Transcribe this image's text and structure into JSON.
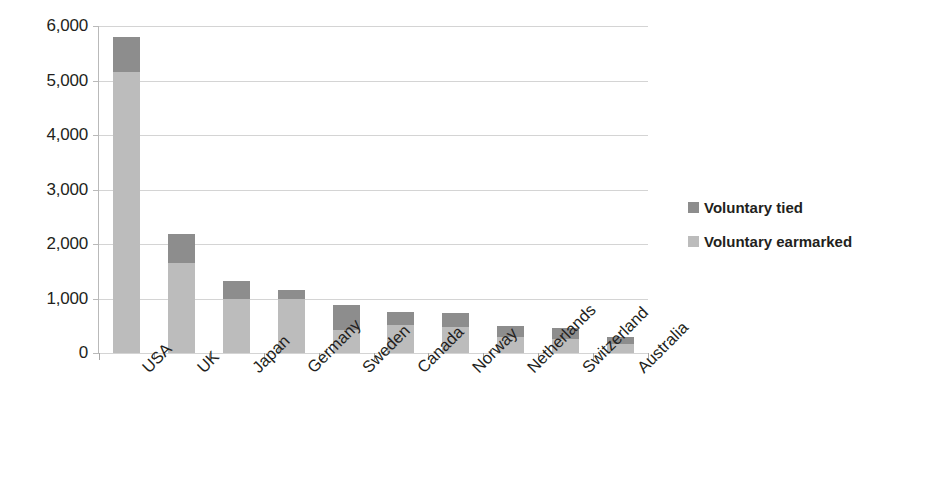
{
  "chart_data": {
    "type": "bar",
    "subtype": "stacked-vertical",
    "title": "",
    "xlabel": "",
    "ylabel": "",
    "ylim": [
      0,
      6000
    ],
    "ytick_labels": [
      "6,000",
      "5,000",
      "4,000",
      "3,000",
      "2,000",
      "1,000",
      "0"
    ],
    "ytick_values": [
      6000,
      5000,
      4000,
      3000,
      2000,
      1000,
      0
    ],
    "grid": true,
    "grid_axis": "y",
    "legend_position": "right",
    "categories": [
      "USA",
      "UK",
      "Japan",
      "Germany",
      "Sweden",
      "Canada",
      "Norway",
      "Netherlands",
      "Switzerland",
      "Australia"
    ],
    "series": [
      {
        "name": "Voluntary earmarked",
        "color": "#bcbcbc",
        "values": [
          5150,
          1660,
          990,
          990,
          430,
          520,
          480,
          295,
          260,
          165
        ]
      },
      {
        "name": "Voluntary tied",
        "color": "#8d8d8d",
        "values": [
          650,
          530,
          330,
          165,
          450,
          230,
          260,
          200,
          200,
          125
        ]
      }
    ],
    "totals": [
      5800,
      2190,
      1320,
      1155,
      880,
      750,
      740,
      495,
      460,
      290
    ]
  },
  "axes": {
    "y": {
      "ticks": [
        {
          "label": "6,000",
          "value": 6000
        },
        {
          "label": "5,000",
          "value": 5000
        },
        {
          "label": "4,000",
          "value": 4000
        },
        {
          "label": "3,000",
          "value": 3000
        },
        {
          "label": "2,000",
          "value": 2000
        },
        {
          "label": "1,000",
          "value": 1000
        },
        {
          "label": "0",
          "value": 0
        }
      ]
    },
    "x": {
      "ticks": [
        {
          "label": "USA"
        },
        {
          "label": "UK"
        },
        {
          "label": "Japan"
        },
        {
          "label": "Germany"
        },
        {
          "label": "Sweden"
        },
        {
          "label": "Canada"
        },
        {
          "label": "Norway"
        },
        {
          "label": "Netherlands"
        },
        {
          "label": "Switzerland"
        },
        {
          "label": "Australia"
        }
      ]
    }
  },
  "legend": {
    "items": [
      {
        "label": "Voluntary tied",
        "color": "#8d8d8d",
        "swatch_name": "legend-swatch-voluntary-tied"
      },
      {
        "label": "Voluntary earmarked",
        "color": "#bcbcbc",
        "swatch_name": "legend-swatch-voluntary-earmarked"
      }
    ]
  },
  "colors": {
    "voluntary_tied": "#8d8d8d",
    "voluntary_earmarked": "#bcbcbc",
    "gridline": "#d4d4d4",
    "axis": "#a8a8a8",
    "text": "#231f20",
    "background": "#ffffff"
  }
}
